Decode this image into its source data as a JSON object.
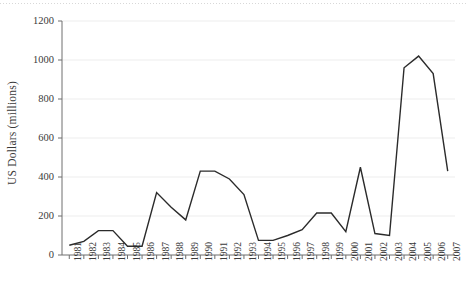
{
  "chart_data": {
    "type": "line",
    "title": "",
    "xlabel": "",
    "ylabel": "US Dollars (millions)",
    "ylim": [
      0,
      1200
    ],
    "yticks": [
      0,
      200,
      400,
      600,
      800,
      1000,
      1200
    ],
    "ytick_labels": [
      "0",
      "200",
      "400",
      "600",
      "800",
      "1000",
      "1200"
    ],
    "grid": true,
    "legend": "none",
    "line_color": "#2b2b2b",
    "categories": [
      "1981",
      "1982",
      "1983",
      "1984",
      "1985",
      "1986",
      "1987",
      "1988",
      "1989",
      "1990",
      "1991",
      "1992",
      "1993",
      "1994",
      "1995",
      "1996",
      "1997",
      "1998",
      "1999",
      "2000",
      "2001",
      "2002",
      "2003",
      "2004",
      "2005",
      "2006",
      "2007"
    ],
    "x": [
      1981,
      1982,
      1983,
      1984,
      1985,
      1986,
      1987,
      1988,
      1989,
      1990,
      1991,
      1992,
      1993,
      1994,
      1995,
      1996,
      1997,
      1998,
      1999,
      2000,
      2001,
      2002,
      2003,
      2004,
      2005,
      2006,
      2007
    ],
    "values": [
      50,
      70,
      125,
      125,
      45,
      45,
      320,
      245,
      180,
      430,
      430,
      390,
      310,
      75,
      75,
      100,
      130,
      215,
      215,
      120,
      450,
      110,
      100,
      960,
      1020,
      930,
      430
    ],
    "series": [
      {
        "name": "US Dollars (millions)",
        "values": [
          50,
          70,
          125,
          125,
          45,
          45,
          320,
          245,
          180,
          430,
          430,
          390,
          310,
          75,
          75,
          100,
          130,
          215,
          215,
          120,
          450,
          110,
          100,
          960,
          1020,
          930,
          430
        ]
      }
    ]
  },
  "axes": {
    "y_axis_label": "US Dollars (millions)"
  }
}
